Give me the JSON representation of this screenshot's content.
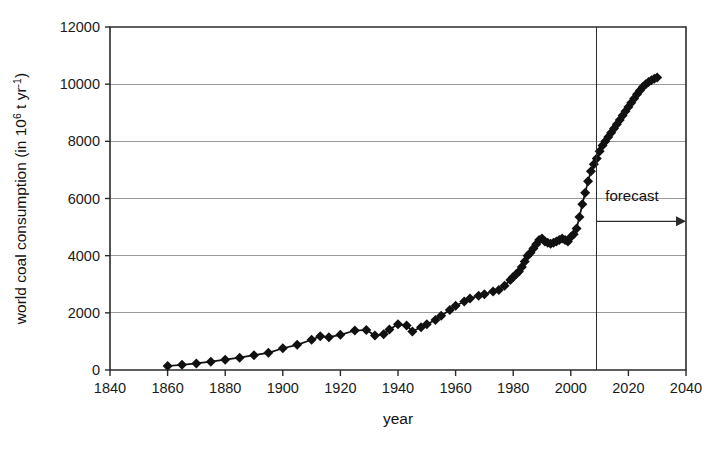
{
  "chart_data": {
    "type": "line",
    "title": "",
    "subtitle": "",
    "xlabel": "year",
    "ylabel": "world coal consumption (in 10⁶ t yr⁻¹)",
    "ylabel_parts": {
      "main_prefix": "world coal consumption (in 10",
      "sup1": "6",
      "mid": " t yr",
      "sup2": "-1",
      "suffix": ")"
    },
    "xlim": [
      1840,
      2040
    ],
    "ylim": [
      0,
      12000
    ],
    "xticks": [
      1840,
      1860,
      1880,
      1900,
      1920,
      1940,
      1960,
      1980,
      2000,
      2020,
      2040
    ],
    "yticks": [
      0,
      2000,
      4000,
      6000,
      8000,
      10000,
      12000
    ],
    "xtick_labels": [
      "1840",
      "1860",
      "1880",
      "1900",
      "1920",
      "1940",
      "1960",
      "1980",
      "2000",
      "2020",
      "2040"
    ],
    "ytick_labels": [
      "0",
      "2000",
      "4000",
      "6000",
      "8000",
      "10000",
      "12000"
    ],
    "grid": {
      "horizontal": true,
      "vertical": false,
      "color": "#9a9a9a"
    },
    "legend": {
      "visible": false,
      "position": "none",
      "entries": []
    },
    "marker": {
      "shape": "diamond",
      "color": "#111111",
      "size": 5
    },
    "line_color": "#111111",
    "background_color": "#ffffff",
    "axis_color": "#2b2b2b",
    "annotations": [
      {
        "name": "forecast-divider",
        "type": "vline",
        "x": 2009,
        "label": ""
      },
      {
        "name": "forecast-arrow",
        "type": "arrow",
        "x_start": 2009,
        "x_end": 2040,
        "y": 5200,
        "label": "forecast",
        "label_x": 2012,
        "label_y": 6100
      }
    ],
    "series": [
      {
        "name": "world coal consumption",
        "x": [
          1860,
          1865,
          1870,
          1875,
          1880,
          1885,
          1890,
          1895,
          1900,
          1905,
          1910,
          1913,
          1916,
          1920,
          1925,
          1929,
          1932,
          1935,
          1937,
          1940,
          1943,
          1945,
          1948,
          1950,
          1953,
          1955,
          1958,
          1960,
          1963,
          1965,
          1968,
          1970,
          1973,
          1975,
          1977,
          1979,
          1980,
          1981,
          1982,
          1983,
          1984,
          1985,
          1986,
          1987,
          1988,
          1989,
          1990,
          1991,
          1992,
          1993,
          1994,
          1995,
          1996,
          1997,
          1998,
          1999,
          2000,
          2001,
          2002,
          2003,
          2004,
          2005,
          2006,
          2007,
          2008,
          2009,
          2010,
          2011,
          2012,
          2013,
          2014,
          2015,
          2016,
          2017,
          2018,
          2019,
          2020,
          2021,
          2022,
          2023,
          2024,
          2025,
          2026,
          2027,
          2028,
          2029,
          2030
        ],
        "y": [
          140,
          180,
          230,
          290,
          360,
          430,
          520,
          600,
          760,
          880,
          1060,
          1180,
          1150,
          1230,
          1380,
          1400,
          1210,
          1250,
          1420,
          1600,
          1560,
          1350,
          1500,
          1600,
          1750,
          1900,
          2100,
          2250,
          2400,
          2500,
          2600,
          2650,
          2750,
          2800,
          2950,
          3150,
          3250,
          3350,
          3450,
          3600,
          3800,
          4000,
          4100,
          4250,
          4400,
          4550,
          4600,
          4500,
          4450,
          4420,
          4450,
          4500,
          4550,
          4600,
          4550,
          4500,
          4650,
          4750,
          4950,
          5350,
          5800,
          6200,
          6600,
          6950,
          7200,
          7400,
          7650,
          7850,
          8000,
          8150,
          8300,
          8450,
          8600,
          8750,
          8900,
          9050,
          9200,
          9350,
          9500,
          9650,
          9780,
          9900,
          10000,
          10080,
          10140,
          10190,
          10230
        ]
      }
    ]
  },
  "figure": {
    "width": 719,
    "height": 454,
    "plot_area": {
      "left": 110,
      "top": 27,
      "right": 686,
      "bottom": 370
    }
  }
}
